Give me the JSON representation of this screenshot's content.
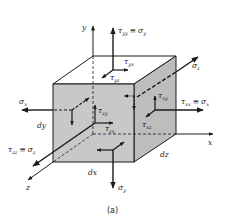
{
  "figure": {
    "caption": "(a)",
    "colors": {
      "face_fill": "#c8c8c8",
      "face_fill_side": "#bdbdbd",
      "face_fill_top": "#ffffff",
      "line": "#1a1a1a"
    }
  },
  "axes": {
    "x": "x",
    "y": "y",
    "z": "z"
  },
  "dimensions": {
    "dx": "dx",
    "dy": "dy",
    "dz": "dz"
  },
  "labels": {
    "tau_yy": {
      "main": "τ",
      "sub": "yy",
      "eq": "≡",
      "main2": "σ",
      "sub2": "y"
    },
    "tau_yx": {
      "main": "τ",
      "sub": "yx"
    },
    "tau_yz": {
      "main": "τ",
      "sub": "yz"
    },
    "sigma_z_top": {
      "main": "σ",
      "sub": "z"
    },
    "tau_xy": {
      "main": "τ",
      "sub": "xy"
    },
    "tau_xx": {
      "main": "τ",
      "sub": "xx",
      "eq": "≡",
      "main2": "σ",
      "sub2": "x"
    },
    "tau_xz": {
      "main": "τ",
      "sub": "xz"
    },
    "sigma_x_left": {
      "main": "σ",
      "sub": "x"
    },
    "tau_zy": {
      "main": "τ",
      "sub": "zy"
    },
    "tau_zx": {
      "main": "τ",
      "sub": "zx"
    },
    "tau_zz": {
      "main": "τ",
      "sub": "zz",
      "eq": "≡",
      "main2": "σ",
      "sub2": "z"
    },
    "sigma_y_bottom": {
      "main": "σ",
      "sub": "y"
    }
  }
}
